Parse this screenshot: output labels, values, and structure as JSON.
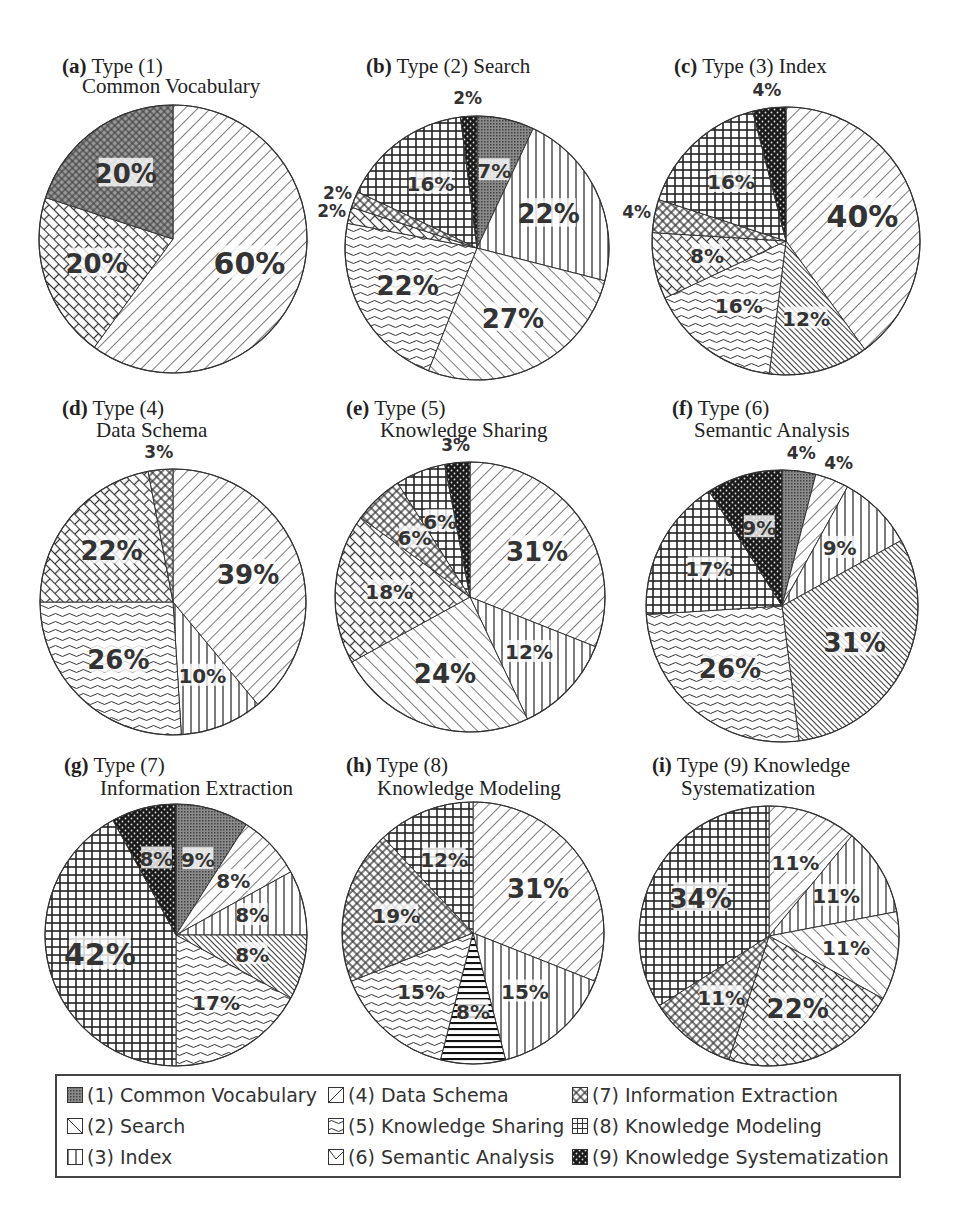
{
  "legend": {
    "items": [
      {
        "key": "1",
        "label": "(1) Common Vocabulary",
        "pattern": "dots-gray"
      },
      {
        "key": "2",
        "label": "(2) Search",
        "pattern": "backdiag"
      },
      {
        "key": "3",
        "label": "(3) Index",
        "pattern": "vert"
      },
      {
        "key": "4",
        "label": "(4) Data Schema",
        "pattern": "fwddiag"
      },
      {
        "key": "5",
        "label": "(5) Knowledge Sharing",
        "pattern": "wave"
      },
      {
        "key": "6",
        "label": "(6) Semantic Analysis",
        "pattern": "densediag"
      },
      {
        "key": "7",
        "label": "(7) Information Extraction",
        "pattern": "diamond"
      },
      {
        "key": "8",
        "label": "(8) Knowledge Modeling",
        "pattern": "grid"
      },
      {
        "key": "9",
        "label": "(9) Knowledge Systematization",
        "pattern": "black-dots"
      }
    ]
  },
  "chart_data": [
    {
      "type": "pie",
      "id": "a",
      "title_prefix": "(a)",
      "title": "Type (1)",
      "subtitle": "Common Vocabulary",
      "slices": [
        {
          "pattern": "backdiag",
          "value": 60,
          "label": "60%"
        },
        {
          "pattern": "brick",
          "value": 20,
          "label": "20%"
        },
        {
          "pattern": "dots-gray-diamond",
          "value": 20,
          "label": "20%"
        }
      ]
    },
    {
      "type": "pie",
      "id": "b",
      "title_prefix": "(b)",
      "title": "Type (2) Search",
      "subtitle": "",
      "slices": [
        {
          "pattern": "dots-gray",
          "value": 7,
          "label": "7%"
        },
        {
          "pattern": "vert",
          "value": 22,
          "label": "22%"
        },
        {
          "pattern": "fwddiag",
          "value": 27,
          "label": "27%"
        },
        {
          "pattern": "wave",
          "value": 22,
          "label": "22%"
        },
        {
          "pattern": "brick",
          "value": 2,
          "label": "2%"
        },
        {
          "pattern": "diamond",
          "value": 2,
          "label": "2%"
        },
        {
          "pattern": "grid",
          "value": 16,
          "label": "16%"
        },
        {
          "pattern": "black-dots",
          "value": 2,
          "label": "2%"
        }
      ]
    },
    {
      "type": "pie",
      "id": "c",
      "title_prefix": "(c)",
      "title": "Type (3) Index",
      "subtitle": "",
      "slices": [
        {
          "pattern": "backdiag",
          "value": 40,
          "label": "40%"
        },
        {
          "pattern": "densediag",
          "value": 12,
          "label": "12%"
        },
        {
          "pattern": "wave",
          "value": 16,
          "label": "16%"
        },
        {
          "pattern": "brick",
          "value": 8,
          "label": "8%"
        },
        {
          "pattern": "diamond",
          "value": 4,
          "label": "4%"
        },
        {
          "pattern": "grid",
          "value": 16,
          "label": "16%"
        },
        {
          "pattern": "black-dots",
          "value": 4,
          "label": "4%"
        }
      ]
    },
    {
      "type": "pie",
      "id": "d",
      "title_prefix": "(d)",
      "title": "Type (4)",
      "subtitle": "Data Schema",
      "slices": [
        {
          "pattern": "backdiag",
          "value": 39,
          "label": "39%"
        },
        {
          "pattern": "vert",
          "value": 10,
          "label": "10%"
        },
        {
          "pattern": "wave",
          "value": 26,
          "label": "26%"
        },
        {
          "pattern": "brick",
          "value": 22,
          "label": "22%"
        },
        {
          "pattern": "diamond",
          "value": 3,
          "label": "3%"
        }
      ]
    },
    {
      "type": "pie",
      "id": "e",
      "title_prefix": "(e)",
      "title": "Type (5)",
      "subtitle": "Knowledge Sharing",
      "slices": [
        {
          "pattern": "backdiag",
          "value": 31,
          "label": "31%"
        },
        {
          "pattern": "vert",
          "value": 12,
          "label": "12%"
        },
        {
          "pattern": "fwddiag",
          "value": 24,
          "label": "24%"
        },
        {
          "pattern": "brick",
          "value": 18,
          "label": "18%"
        },
        {
          "pattern": "diamond",
          "value": 6,
          "label": "6%"
        },
        {
          "pattern": "grid",
          "value": 6,
          "label": "6%"
        },
        {
          "pattern": "black-dots",
          "value": 3,
          "label": "3%"
        }
      ]
    },
    {
      "type": "pie",
      "id": "f",
      "title_prefix": "(f)",
      "title": "Type (6)",
      "subtitle": "Semantic Analysis",
      "slices": [
        {
          "pattern": "dots-gray",
          "value": 4,
          "label": "4%"
        },
        {
          "pattern": "backdiag",
          "value": 4,
          "label": "4%"
        },
        {
          "pattern": "vert",
          "value": 9,
          "label": "9%"
        },
        {
          "pattern": "densediag",
          "value": 31,
          "label": "31%"
        },
        {
          "pattern": "wave",
          "value": 26,
          "label": "26%"
        },
        {
          "pattern": "grid",
          "value": 17,
          "label": "17%"
        },
        {
          "pattern": "black-dots",
          "value": 9,
          "label": "9%"
        }
      ]
    },
    {
      "type": "pie",
      "id": "g",
      "title_prefix": "(g)",
      "title": "Type (7)",
      "subtitle": "Information Extraction",
      "slices": [
        {
          "pattern": "dots-gray",
          "value": 9,
          "label": "9%"
        },
        {
          "pattern": "backdiag",
          "value": 8,
          "label": "8%"
        },
        {
          "pattern": "vert",
          "value": 8,
          "label": "8%"
        },
        {
          "pattern": "densediag",
          "value": 8,
          "label": "8%"
        },
        {
          "pattern": "wave",
          "value": 17,
          "label": "17%"
        },
        {
          "pattern": "grid",
          "value": 42,
          "label": "42%"
        },
        {
          "pattern": "black-dots",
          "value": 8,
          "label": "8%"
        }
      ]
    },
    {
      "type": "pie",
      "id": "h",
      "title_prefix": "(h)",
      "title": "Type (8)",
      "subtitle": "Knowledge Modeling",
      "slices": [
        {
          "pattern": "backdiag",
          "value": 31,
          "label": "31%"
        },
        {
          "pattern": "vert",
          "value": 15,
          "label": "15%"
        },
        {
          "pattern": "horiz",
          "value": 8,
          "label": "8%"
        },
        {
          "pattern": "wave",
          "value": 15,
          "label": "15%"
        },
        {
          "pattern": "diamond",
          "value": 19,
          "label": "19%"
        },
        {
          "pattern": "grid",
          "value": 12,
          "label": "12%"
        }
      ]
    },
    {
      "type": "pie",
      "id": "i",
      "title_prefix": "(i)",
      "title": "Type (9) Knowledge",
      "subtitle": "Systematization",
      "slices": [
        {
          "pattern": "backdiag",
          "value": 11,
          "label": "11%"
        },
        {
          "pattern": "vert",
          "value": 11,
          "label": "11%"
        },
        {
          "pattern": "fwddiag",
          "value": 11,
          "label": "11%"
        },
        {
          "pattern": "brick",
          "value": 22,
          "label": "22%"
        },
        {
          "pattern": "diamond",
          "value": 11,
          "label": "11%"
        },
        {
          "pattern": "grid",
          "value": 34,
          "label": "34%"
        }
      ]
    }
  ]
}
